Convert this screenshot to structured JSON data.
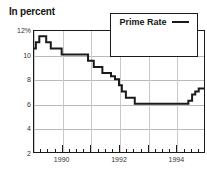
{
  "chart_data": {
    "type": "line",
    "title": "In percent",
    "xlabel": "",
    "ylabel": "",
    "ylim": [
      2,
      12
    ],
    "xlim": [
      1989.0,
      1995.0
    ],
    "grid": true,
    "legend_position": "top-right",
    "y_ticks": [
      2,
      4,
      6,
      8,
      10,
      12
    ],
    "y_tick_labels": [
      "2",
      "4",
      "6",
      "8",
      "10",
      "12%"
    ],
    "x_ticks": [
      1990,
      1992,
      1994
    ],
    "x_tick_labels": [
      "1990",
      "1992",
      "1994"
    ],
    "x_minor_tick_interval": 0.25,
    "series": [
      {
        "name": "Prime Rate",
        "color": "#1a1a1a",
        "style": "step",
        "x": [
          1989.0,
          1989.1,
          1989.22,
          1989.34,
          1989.46,
          1989.62,
          1989.8,
          1990.0,
          1990.75,
          1990.92,
          1991.0,
          1991.12,
          1991.28,
          1991.42,
          1991.58,
          1991.72,
          1991.86,
          1992.0,
          1992.1,
          1992.24,
          1992.42,
          1992.55,
          1993.0,
          1994.0,
          1994.3,
          1994.42,
          1994.55,
          1994.66,
          1994.78,
          1994.9,
          1995.0
        ],
        "y": [
          10.5,
          11.0,
          11.5,
          11.5,
          11.0,
          10.5,
          10.5,
          10.0,
          10.0,
          9.5,
          9.5,
          9.0,
          9.0,
          8.5,
          8.5,
          8.25,
          8.0,
          7.5,
          7.0,
          6.5,
          6.5,
          6.0,
          6.0,
          6.0,
          6.0,
          6.25,
          6.75,
          7.0,
          7.25,
          7.25,
          7.75
        ]
      }
    ],
    "annotations": []
  },
  "legend": {
    "entries": [
      {
        "label": "Prime Rate",
        "color": "#1a1a1a"
      }
    ]
  },
  "colors": {
    "line": "#1a1a1a",
    "frame": "#1a1a1a",
    "grid": "#b9b9b9",
    "background": "#ffffff",
    "text": "#1a1a1a"
  }
}
